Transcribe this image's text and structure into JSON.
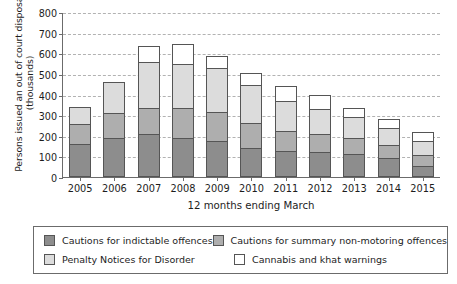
{
  "chart_data": {
    "type": "bar",
    "subtype": "stacked-vertical",
    "title": "",
    "xlabel": "12 months ending March",
    "ylabel": "Persons issued an out of court disposal (thousands)",
    "categories": [
      "2005",
      "2006",
      "2007",
      "2008",
      "2009",
      "2010",
      "2011",
      "2012",
      "2013",
      "2014",
      "2015"
    ],
    "ylim": [
      0,
      800
    ],
    "yticks": [
      0,
      100,
      200,
      300,
      400,
      500,
      600,
      700,
      800
    ],
    "ytick_labels": [
      "0",
      "100",
      "200",
      "300",
      "400",
      "500",
      "600",
      "700",
      "800"
    ],
    "grid": true,
    "grid_axis": "y",
    "legend_position": "bottom",
    "series": [
      {
        "name": "Cautions for indictable offences",
        "color": "#8d8d8d",
        "values": [
          160,
          190,
          210,
          190,
          175,
          140,
          125,
          120,
          110,
          90,
          55
        ]
      },
      {
        "name": "Cautions for summary non-motoring offences",
        "color": "#aeaeae",
        "values": [
          100,
          125,
          130,
          150,
          145,
          125,
          105,
          95,
          85,
          70,
          55
        ]
      },
      {
        "name": "Penalty Notices for Disorder",
        "color": "#dcdcdc",
        "values": [
          90,
          155,
          225,
          220,
          220,
          190,
          150,
          125,
          105,
          85,
          75
        ]
      },
      {
        "name": "Cannabis and khat warnings",
        "color": "#ffffff",
        "values": [
          0,
          0,
          85,
          100,
          60,
          65,
          75,
          70,
          50,
          50,
          50
        ]
      }
    ],
    "totals": [
      350,
      470,
      650,
      660,
      600,
      520,
      455,
      410,
      350,
      295,
      235
    ]
  },
  "axis": {
    "y_title": "Persons issued an out of court disposal",
    "y_title_sub": "(thousands)",
    "x_title": "12 months ending March"
  },
  "legend": {
    "entries": [
      {
        "label": "Cautions for indictable offences",
        "color": "#8d8d8d"
      },
      {
        "label": "Cautions for summary non-motoring offences",
        "color": "#aeaeae"
      },
      {
        "label": "Penalty Notices for Disorder",
        "color": "#dcdcdc"
      },
      {
        "label": "Cannabis and khat warnings",
        "color": "#ffffff"
      }
    ]
  }
}
